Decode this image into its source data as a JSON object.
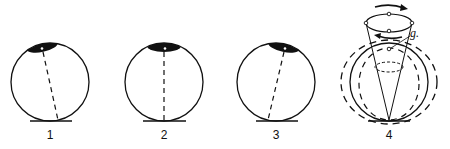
{
  "figures": [
    {
      "id": 1,
      "label": "1",
      "description": "sphere tilted, axis leaning right-to-left from contact point",
      "tilt": "left"
    },
    {
      "id": 2,
      "label": "2",
      "description": "sphere upright, vertical axis",
      "tilt": "none"
    },
    {
      "id": 3,
      "label": "3",
      "description": "sphere tilted, axis leaning left-to-right from contact point",
      "tilt": "right"
    },
    {
      "id": 4,
      "label": "4",
      "description": "precession cone with oscillating outlines",
      "tilt": "precessing"
    }
  ],
  "annotations": {
    "g_label": "g."
  },
  "colors": {
    "ink": "#111111",
    "background": "#ffffff"
  }
}
